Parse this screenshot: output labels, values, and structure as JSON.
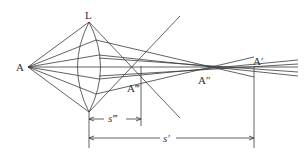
{
  "diagram": {
    "type": "optical ray diagram - spherical aberration of a convex lens",
    "labels": {
      "object_point": "A",
      "lens": "L",
      "paraxial_image": "A′",
      "intermediate_image": "A″",
      "marginal_image": "A‴",
      "marginal_distance": "s‴",
      "paraxial_distance": "s′"
    },
    "colors": {
      "line": "#3a3a3a",
      "background": "#ffffff"
    }
  }
}
